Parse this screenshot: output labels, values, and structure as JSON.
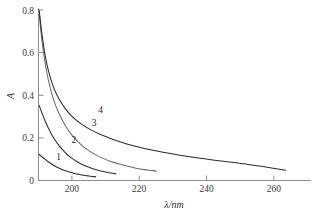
{
  "figure": {
    "background_color": "#ffffff",
    "axis_color": "#8c8c8c",
    "text_color": "#2c2c2c"
  },
  "chart_data": {
    "type": "line",
    "title": "",
    "subtitle": "",
    "xlabel": "λ/nm",
    "ylabel": "A",
    "xlim": [
      190,
      271
    ],
    "ylim": [
      0,
      0.8
    ],
    "xticks": [
      200,
      220,
      240,
      260
    ],
    "yticks": [
      0,
      0.2,
      0.4,
      0.6,
      0.8
    ],
    "xtick_labels": [
      "200",
      "220",
      "240",
      "260"
    ],
    "ytick_labels": [
      "0",
      "0.2",
      "0.4",
      "0.6",
      "0.8"
    ],
    "grid": false,
    "legend": "inline-curve-labels",
    "annotations": [
      {
        "text": "1",
        "x": 196.0,
        "y": 0.098
      },
      {
        "text": "2",
        "x": 200.5,
        "y": 0.175
      },
      {
        "text": "3",
        "x": 206.5,
        "y": 0.258
      },
      {
        "text": "4",
        "x": 208.5,
        "y": 0.315
      }
    ],
    "series": [
      {
        "name": "1",
        "color": "#2b2b2b",
        "x": [
          190.2,
          191.0,
          192.0,
          193.0,
          194.0,
          195.0,
          196.0,
          197.0,
          198.0,
          199.0,
          200.0,
          201.0,
          202.0,
          203.0,
          204.0,
          205.0,
          206.0,
          207.0
        ],
        "y": [
          0.122,
          0.112,
          0.099,
          0.087,
          0.076,
          0.067,
          0.059,
          0.052,
          0.046,
          0.041,
          0.036,
          0.032,
          0.029,
          0.026,
          0.023,
          0.021,
          0.019,
          0.017
        ]
      },
      {
        "name": "2",
        "color": "#2b2b2b",
        "x": [
          190.2,
          191.0,
          192.0,
          193.0,
          194.0,
          195.0,
          196.0,
          197.0,
          198.0,
          199.0,
          200.0,
          201.5,
          203.0,
          204.5,
          206.0,
          207.5,
          209.0,
          210.5,
          212.0,
          213.0
        ],
        "y": [
          0.352,
          0.318,
          0.278,
          0.244,
          0.214,
          0.188,
          0.166,
          0.147,
          0.13,
          0.116,
          0.104,
          0.088,
          0.075,
          0.065,
          0.056,
          0.049,
          0.043,
          0.038,
          0.034,
          0.032
        ]
      },
      {
        "name": "3",
        "color": "#6b6b6b",
        "x": [
          190.2,
          191.0,
          192.0,
          193.0,
          194.5,
          196.0,
          198.0,
          200.0,
          202.0,
          204.0,
          206.5,
          209.0,
          211.5,
          214.0,
          216.5,
          219.0,
          221.5,
          223.5,
          225.0
        ],
        "y": [
          0.78,
          0.66,
          0.548,
          0.466,
          0.378,
          0.318,
          0.257,
          0.212,
          0.178,
          0.151,
          0.125,
          0.105,
          0.089,
          0.077,
          0.067,
          0.058,
          0.051,
          0.047,
          0.044
        ]
      },
      {
        "name": "4",
        "color": "#2b2b2b",
        "x": [
          190.2,
          191.0,
          192.0,
          193.0,
          194.5,
          196.0,
          198.0,
          200.0,
          203.0,
          206.0,
          209.0,
          212.0,
          216.0,
          220.0,
          224.0,
          228.0,
          233.0,
          238.0,
          243.0,
          248.0,
          253.0,
          258.0,
          263.5
        ],
        "y": [
          0.8,
          0.69,
          0.585,
          0.512,
          0.436,
          0.386,
          0.336,
          0.3,
          0.262,
          0.234,
          0.212,
          0.194,
          0.173,
          0.156,
          0.142,
          0.13,
          0.116,
          0.104,
          0.094,
          0.084,
          0.074,
          0.062,
          0.048
        ]
      }
    ]
  }
}
